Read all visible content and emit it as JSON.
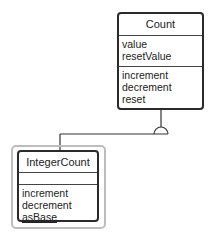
{
  "diagram": {
    "type": "uml-class-diagram",
    "classes": [
      {
        "id": "count",
        "name": "Count",
        "attributes": [
          "value",
          "resetValue"
        ],
        "methods": [
          "increment",
          "decrement",
          "reset"
        ],
        "selected": false
      },
      {
        "id": "integer-count",
        "name": "IntegerCount",
        "attributes": [],
        "methods": [
          "increment",
          "decrement",
          "asBase"
        ],
        "static_methods": [
          "asBase"
        ],
        "selected": true
      }
    ],
    "relationships": [
      {
        "type": "inheritance",
        "from": "IntegerCount",
        "to": "Count"
      }
    ],
    "colors": {
      "box_border": "#2a2a2a",
      "selection_frame": "#bdbdbd",
      "line": "#333333"
    }
  }
}
